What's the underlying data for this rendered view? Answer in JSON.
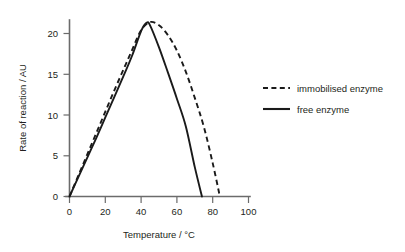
{
  "chart_data": {
    "type": "line",
    "title": "",
    "xlabel": "Temperature / °C",
    "ylabel": "Rate of reaction / AU",
    "xlim": [
      0,
      100
    ],
    "ylim": [
      0,
      22
    ],
    "grid": false,
    "legend_position": "right",
    "xticks": [
      0,
      20,
      40,
      60,
      80,
      100
    ],
    "xtick_labels": [
      "0",
      "20",
      "40",
      "60",
      "80",
      "100"
    ],
    "yticks": [
      0,
      5,
      10,
      15,
      20
    ],
    "ytick_labels": [
      "0",
      "5",
      "10",
      "15",
      "20"
    ],
    "series": [
      {
        "name": "immobilised enzyme",
        "style": "dashed",
        "color": "#1a1a1a",
        "x": [
          0,
          5,
          10,
          15,
          20,
          25,
          30,
          35,
          40,
          45,
          50,
          55,
          60,
          65,
          70,
          75,
          80,
          84
        ],
        "values": [
          0,
          2.6,
          5.2,
          7.8,
          10.4,
          13.0,
          15.5,
          18.0,
          20.4,
          21.4,
          21.0,
          19.8,
          17.9,
          15.3,
          12.1,
          8.6,
          4.1,
          0
        ]
      },
      {
        "name": "free enzyme",
        "style": "solid",
        "color": "#1a1a1a",
        "x": [
          0,
          5,
          10,
          15,
          20,
          25,
          30,
          35,
          40,
          43,
          45,
          50,
          55,
          60,
          65,
          70,
          74
        ],
        "values": [
          0,
          2.4,
          4.8,
          7.2,
          9.7,
          12.2,
          14.7,
          17.3,
          20.3,
          21.3,
          21.0,
          18.3,
          15.2,
          12.0,
          8.6,
          3.6,
          0
        ]
      }
    ]
  },
  "legend": {
    "items": [
      {
        "label": "immobilised enzyme",
        "style": "dashed"
      },
      {
        "label": "free enzyme",
        "style": "solid"
      }
    ]
  }
}
